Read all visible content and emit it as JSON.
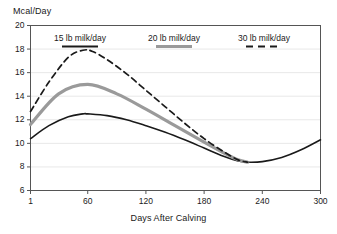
{
  "chart_data": {
    "type": "line",
    "title": "",
    "xlabel": "Days After Calving",
    "ylabel": "Mcal/Day",
    "xlim": [
      1,
      300
    ],
    "ylim": [
      6,
      20
    ],
    "xticks": [
      "1",
      "60",
      "120",
      "180",
      "240",
      "300"
    ],
    "xtick_values": [
      1,
      60,
      120,
      180,
      240,
      300
    ],
    "yticks": [
      "6",
      "8",
      "10",
      "12",
      "14",
      "16",
      "18",
      "20"
    ],
    "ytick_values": [
      6,
      8,
      10,
      12,
      14,
      16,
      18,
      20
    ],
    "grid": true,
    "grid_axis": "y",
    "legend_position": "top-inside",
    "series": [
      {
        "name": "15 lb milk/day",
        "style": "solid",
        "color": "#1a1a1a",
        "width": 1.6,
        "x": [
          1,
          20,
          40,
          55,
          60,
          80,
          100,
          120,
          140,
          160,
          180,
          200,
          215,
          225,
          240,
          260,
          280,
          300
        ],
        "y": [
          10.4,
          11.5,
          12.25,
          12.5,
          12.5,
          12.35,
          12.0,
          11.5,
          10.95,
          10.3,
          9.6,
          8.9,
          8.5,
          8.4,
          8.45,
          8.8,
          9.45,
          10.3
        ]
      },
      {
        "name": "20 lb milk/day",
        "style": "solid",
        "color": "#9a9a9a",
        "width": 3.2,
        "x": [
          1,
          30,
          60,
          90,
          120,
          150,
          180,
          200,
          215,
          225
        ],
        "y": [
          11.6,
          14.2,
          15.0,
          14.2,
          12.9,
          11.5,
          10.1,
          9.2,
          8.6,
          8.4
        ]
      },
      {
        "name": "30 lb milk/day",
        "style": "dashed",
        "color": "#1a1a1a",
        "width": 1.7,
        "x": [
          1,
          20,
          40,
          55,
          65,
          80,
          100,
          120,
          140,
          160,
          180,
          200,
          215,
          225
        ],
        "y": [
          12.7,
          15.2,
          17.3,
          17.9,
          17.8,
          17.1,
          15.9,
          14.5,
          13.1,
          11.7,
          10.4,
          9.3,
          8.6,
          8.4
        ]
      }
    ],
    "legend_entries": [
      {
        "label": "15 lb milk/day",
        "style": "solid",
        "color": "#1a1a1a"
      },
      {
        "label": "20 lb milk/day",
        "style": "solid",
        "color": "#9a9a9a"
      },
      {
        "label": "30 lb milk/day",
        "style": "dashed",
        "color": "#1a1a1a"
      }
    ]
  },
  "colors": {
    "axis": "#555555",
    "grid": "#e8e8e8",
    "text": "#1a1a1a",
    "series_dark": "#1a1a1a",
    "series_gray": "#9a9a9a",
    "background": "#ffffff"
  }
}
